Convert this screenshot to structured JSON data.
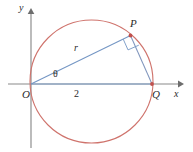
{
  "figure": {
    "background_color": "#ffffff",
    "width": 193,
    "height": 152,
    "colors": {
      "circle": "#cf736c",
      "chord": "#7496c4",
      "diameter": "#7e9fc9",
      "axis": "#8a8a8a",
      "vertex_dot": "#c0504d",
      "label_text": "#2b2b2b"
    },
    "axes": {
      "x_label": "x",
      "y_label": "y",
      "origin_label": "O",
      "x_axis": {
        "x1": 8,
        "y1": 84,
        "x2": 182,
        "y2": 84
      },
      "y_axis": {
        "x1": 31,
        "y1": 148,
        "x2": 31,
        "y2": 10
      }
    },
    "circle": {
      "center_x": 91.5,
      "center_y": 81.5,
      "radius": 61.5
    },
    "points": [
      {
        "name": "O",
        "label": "O",
        "x": 31,
        "y": 84,
        "dot": false
      },
      {
        "name": "Q",
        "label": "Q",
        "x": 152,
        "y": 84,
        "dot": true
      },
      {
        "name": "P",
        "label": "P",
        "x": 130.5,
        "y": 35.5,
        "dot": true
      }
    ],
    "segments": [
      {
        "name": "radius-segment-OP",
        "label": "r",
        "from": "O",
        "to": "P"
      },
      {
        "name": "diameter-segment-OQ",
        "label": "2",
        "from": "O",
        "to": "Q"
      },
      {
        "name": "chord-segment-PQ",
        "label": "",
        "from": "P",
        "to": "Q"
      }
    ],
    "labels": {
      "radius": "r",
      "diameter": "2",
      "angle": "θ",
      "point_p": "P",
      "point_q": "Q",
      "point_o": "O",
      "axis_x": "x",
      "axis_y": "y"
    },
    "markers": {
      "right_angle_at": "P",
      "angle_theta_at": "O"
    }
  }
}
